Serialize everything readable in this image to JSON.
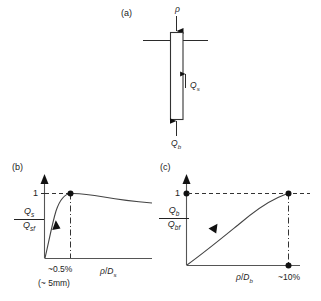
{
  "figure": {
    "panels": [
      {
        "key": "a",
        "label": "(a)"
      },
      {
        "key": "b",
        "label": "(b)"
      },
      {
        "key": "c",
        "label": "(c)"
      }
    ]
  },
  "pile_diagram": {
    "settlement_symbol": "ρ",
    "shaft_load_symbol": "Q",
    "shaft_load_subscript": "s",
    "base_load_symbol": "Q",
    "base_load_subscript": "b",
    "ground_line_name": "ground-line",
    "arrow_down_name": "settlement-arrow",
    "arrow_up_shaft_name": "shaft-resistance-arrow",
    "arrow_up_base_name": "base-resistance-arrow"
  },
  "chart_b": {
    "type": "line",
    "title": "(b)",
    "xlabel_numerator": "ρ",
    "xlabel_denominator": "D",
    "xlabel_denominator_sub": "s",
    "xlabel_full": "ρ/Ds",
    "ylabel_numerator": "Q",
    "ylabel_numerator_sub": "s",
    "ylabel_denominator": "Q",
    "ylabel_denominator_sub": "sf",
    "ylabel_full": "Qs/Qsf",
    "ytick_label": "1",
    "annotation_peak_strain": "~0.5%",
    "annotation_peak_displacement": "(~ 5mm)",
    "xlim": [
      0,
      1
    ],
    "ylim": [
      0,
      1.18
    ],
    "peak_x": 0.245,
    "peak_y": 1.0,
    "x": [
      0.0,
      0.03,
      0.06,
      0.09,
      0.12,
      0.16,
      0.2,
      0.245,
      0.3,
      0.4,
      0.55,
      0.7,
      0.85,
      1.0
    ],
    "y": [
      0.0,
      0.2,
      0.42,
      0.62,
      0.78,
      0.9,
      0.97,
      1.0,
      1.0,
      0.985,
      0.955,
      0.93,
      0.91,
      0.9
    ],
    "grid": false,
    "legend": false
  },
  "chart_c": {
    "type": "line",
    "title": "(c)",
    "xlabel_numerator": "ρ",
    "xlabel_denominator": "D",
    "xlabel_denominator_sub": "b",
    "xlabel_full": "ρ/Db",
    "ylabel_numerator": "Q",
    "ylabel_numerator_sub": "b",
    "ylabel_denominator": "Q",
    "ylabel_denominator_sub": "bf",
    "ylabel_full": "Qb/Qbf",
    "ytick_label": "1",
    "annotation_ultimate_strain": "~10%",
    "xlim": [
      0,
      1.22
    ],
    "ylim": [
      0,
      1.18
    ],
    "plateau_x": 1.0,
    "plateau_y": 1.0,
    "x": [
      0.0,
      0.08,
      0.16,
      0.25,
      0.35,
      0.45,
      0.55,
      0.68,
      0.8,
      0.9,
      1.0
    ],
    "y": [
      0.0,
      0.19,
      0.36,
      0.51,
      0.65,
      0.76,
      0.85,
      0.93,
      0.975,
      0.995,
      1.0
    ],
    "grid": false,
    "legend": false
  }
}
